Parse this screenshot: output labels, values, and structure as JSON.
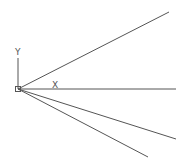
{
  "canvas": {
    "background": "#ffffff",
    "line_color": "#555555"
  },
  "ucs_icon": {
    "origin": [
      18,
      89
    ],
    "y_label": "Y",
    "x_label": "X",
    "y_axis_top": [
      18,
      58
    ]
  },
  "rays": [
    {
      "from": [
        18,
        89
      ],
      "to": [
        169,
        12
      ]
    },
    {
      "from": [
        18,
        89
      ],
      "to": [
        176,
        89
      ]
    },
    {
      "from": [
        18,
        89
      ],
      "to": [
        176,
        139
      ]
    },
    {
      "from": [
        18,
        89
      ],
      "to": [
        148,
        157
      ]
    }
  ]
}
